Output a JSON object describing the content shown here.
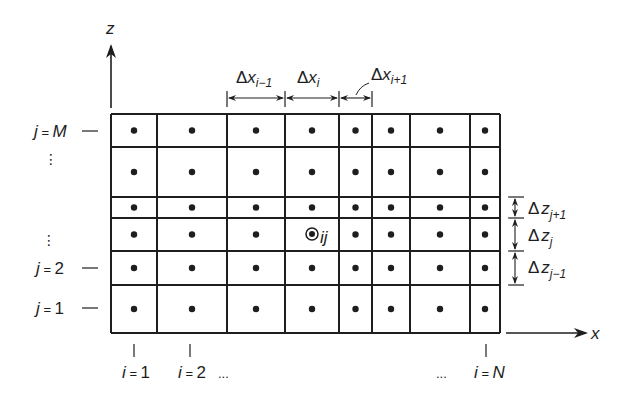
{
  "diagram": {
    "type": "finite-difference grid (block-centered, nonuniform spacing)",
    "ink_color": "#1e1e1e",
    "background": "#ffffff",
    "grid": {
      "x_lines": [
        111,
        157,
        227,
        285,
        339,
        372,
        410,
        470,
        500
      ],
      "z_lines": [
        114,
        147,
        197,
        218,
        251,
        285,
        333
      ],
      "columns": 8,
      "rows": 6
    },
    "highlighted_node": {
      "column": 3,
      "row": 3,
      "label_i": "i",
      "label_j": "j"
    },
    "axes": {
      "z": {
        "label": "z"
      },
      "x": {
        "label": "x"
      }
    },
    "row_labels": [
      {
        "var": "j",
        "eq": " = ",
        "val": "M",
        "val_italic": true
      },
      {
        "var": "j",
        "eq": " = ",
        "val": "2",
        "val_italic": false
      },
      {
        "var": "j",
        "eq": " = ",
        "val": "1",
        "val_italic": false
      }
    ],
    "column_labels": [
      {
        "var": "i",
        "eq": " = ",
        "val": "1",
        "val_italic": false
      },
      {
        "var": "i",
        "eq": " = ",
        "val": "2",
        "val_italic": false
      },
      {
        "var": "i",
        "eq": " = ",
        "val": "N",
        "val_italic": true
      }
    ],
    "ellipsis": "...",
    "vertical_ellipsis": "⋮",
    "dx_labels": [
      {
        "delta": "Δ",
        "var": "x",
        "sub": "i−1"
      },
      {
        "delta": "Δ",
        "var": "x",
        "sub": "i"
      },
      {
        "delta": "Δ",
        "var": "x",
        "sub": "i+1"
      }
    ],
    "dz_labels": [
      {
        "delta": "Δ",
        "var": "z",
        "sub": "j+1"
      },
      {
        "delta": "Δ",
        "var": "z",
        "sub": "j"
      },
      {
        "delta": "Δ",
        "var": "z",
        "sub": "j−1"
      }
    ]
  }
}
